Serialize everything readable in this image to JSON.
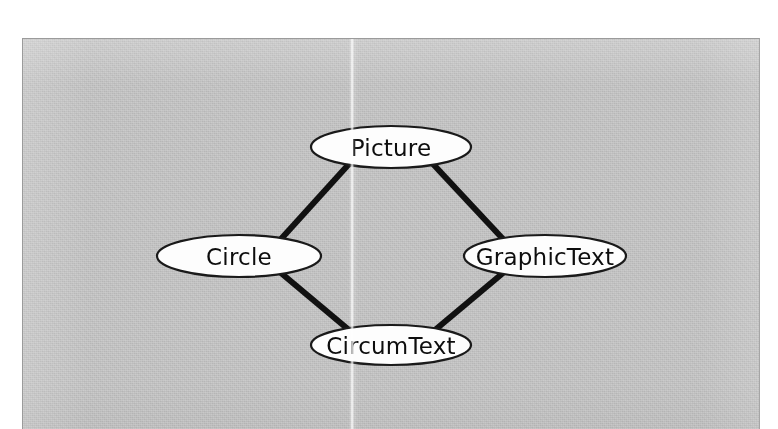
{
  "page": {
    "background_color": "#ffffff",
    "figure": {
      "name": "object-structure-diagram",
      "background_color": "#cbcbcb",
      "border_color": "#9b9b9b",
      "width": 738,
      "height": 391
    }
  },
  "diagram": {
    "type": "node-link-graph",
    "layout": "diamond",
    "node_shape": "ellipse",
    "node_fill": "#fdfdfd",
    "node_stroke": "#1a1a1a",
    "edge_color": "#111111",
    "edge_width": 6,
    "nodes": [
      {
        "id": "picture",
        "label": "Picture",
        "cx": 368,
        "cy": 108,
        "rx": 80,
        "ry": 21
      },
      {
        "id": "circle",
        "label": "Circle",
        "cx": 216,
        "cy": 217,
        "rx": 82,
        "ry": 21
      },
      {
        "id": "graphictext",
        "label": "GraphicText",
        "cx": 522,
        "cy": 217,
        "rx": 81,
        "ry": 21
      },
      {
        "id": "circumtext",
        "label": "CircumText",
        "cx": 368,
        "cy": 306,
        "rx": 80,
        "ry": 20
      }
    ],
    "edges": [
      {
        "id": "picture-circle",
        "from": "Picture",
        "to": "Circle",
        "x1": 326,
        "y1": 125,
        "x2": 258,
        "y2": 200
      },
      {
        "id": "picture-graphictext",
        "from": "Picture",
        "to": "GraphicText",
        "x1": 410,
        "y1": 125,
        "x2": 480,
        "y2": 200
      },
      {
        "id": "circle-circumtext",
        "from": "Circle",
        "to": "CircumText",
        "x1": 258,
        "y1": 234,
        "x2": 326,
        "y2": 291
      },
      {
        "id": "graphictext-circumtext",
        "from": "GraphicText",
        "to": "CircumText",
        "x1": 480,
        "y1": 234,
        "x2": 412,
        "y2": 291
      }
    ]
  }
}
